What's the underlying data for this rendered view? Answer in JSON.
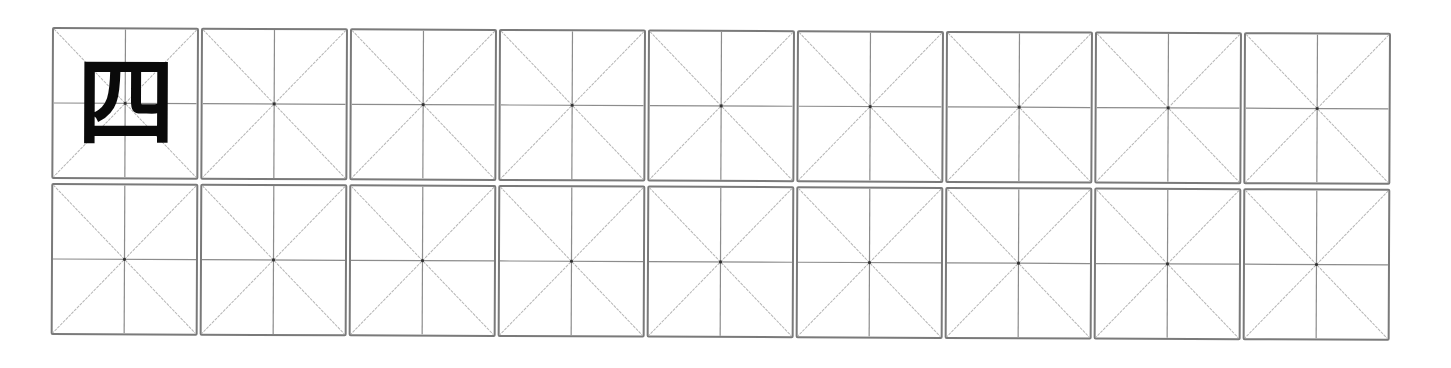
{
  "worksheet": {
    "type": "mizige-practice-grid",
    "rows": 2,
    "columns": 9,
    "model_character": "四",
    "colors": {
      "border": "#7a7a7a",
      "guide_line": "#b5b5b5",
      "center_line": "#8c8c8c",
      "center_dot": "#333333",
      "character": "#0a0a0a"
    },
    "cells": [
      {
        "row": 0,
        "col": 0,
        "text": "四"
      },
      {
        "row": 0,
        "col": 1,
        "text": ""
      },
      {
        "row": 0,
        "col": 2,
        "text": ""
      },
      {
        "row": 0,
        "col": 3,
        "text": ""
      },
      {
        "row": 0,
        "col": 4,
        "text": ""
      },
      {
        "row": 0,
        "col": 5,
        "text": ""
      },
      {
        "row": 0,
        "col": 6,
        "text": ""
      },
      {
        "row": 0,
        "col": 7,
        "text": ""
      },
      {
        "row": 0,
        "col": 8,
        "text": ""
      },
      {
        "row": 1,
        "col": 0,
        "text": ""
      },
      {
        "row": 1,
        "col": 1,
        "text": ""
      },
      {
        "row": 1,
        "col": 2,
        "text": ""
      },
      {
        "row": 1,
        "col": 3,
        "text": ""
      },
      {
        "row": 1,
        "col": 4,
        "text": ""
      },
      {
        "row": 1,
        "col": 5,
        "text": ""
      },
      {
        "row": 1,
        "col": 6,
        "text": ""
      },
      {
        "row": 1,
        "col": 7,
        "text": ""
      },
      {
        "row": 1,
        "col": 8,
        "text": ""
      }
    ]
  }
}
